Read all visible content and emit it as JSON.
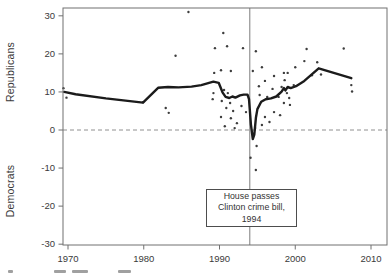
{
  "figure": {
    "background": "#ffffff",
    "ink": "#3a3a3a"
  },
  "chart_data": {
    "type": "scatter",
    "title": "",
    "xlabel": "",
    "ylabel_upper": "Republicans",
    "ylabel_lower": "Democrats",
    "grid": "off",
    "legend": "none",
    "x_axis": {
      "ticks": [
        1970,
        1980,
        1990,
        2000,
        2010
      ],
      "range": [
        1969.3,
        2012.1
      ]
    },
    "y_axis": {
      "ticks": [
        30,
        20,
        10,
        0,
        -10,
        -20,
        -30
      ],
      "range": [
        -32,
        32.1
      ]
    },
    "zero_line_y": 0,
    "event_line_x": 1994,
    "annotation": {
      "lines": [
        "House passes",
        "Clinton crime bill,",
        "1994"
      ]
    },
    "colors": {
      "trend": "#1b1b1b",
      "scatter": "#3d3d3d",
      "event_line": "#7d7d7d",
      "zero_line": "#909090",
      "frame": "#707070",
      "tick_text": "#3a3a3a"
    },
    "series": [
      {
        "name": "observations",
        "kind": "scatter",
        "points": [
          [
            1969.4,
            11.0
          ],
          [
            1969.8,
            8.5
          ],
          [
            1979.9,
            7.3
          ],
          [
            1982.9,
            5.8
          ],
          [
            1983.3,
            4.5
          ],
          [
            1984.2,
            19.5
          ],
          [
            1985.9,
            31.0
          ],
          [
            1989.1,
            8.1
          ],
          [
            1989.2,
            9.7
          ],
          [
            1989.3,
            15.0
          ],
          [
            1989.4,
            21.5
          ],
          [
            1990.2,
            15.7
          ],
          [
            1990.2,
            3.4
          ],
          [
            1990.3,
            7.6
          ],
          [
            1990.5,
            25.5
          ],
          [
            1990.6,
            10.5
          ],
          [
            1990.7,
            1.0
          ],
          [
            1990.9,
            5.8
          ],
          [
            1991.0,
            22.0
          ],
          [
            1991.1,
            9.7
          ],
          [
            1991.4,
            7.1
          ],
          [
            1991.5,
            15.5
          ],
          [
            1991.5,
            3.1
          ],
          [
            1991.8,
            5.0
          ],
          [
            1992.0,
            0.5
          ],
          [
            1992.3,
            1.8
          ],
          [
            1992.9,
            6.3
          ],
          [
            1993.1,
            21.5
          ],
          [
            1993.5,
            4.7
          ],
          [
            1994.1,
            -7.3
          ],
          [
            1994.4,
            15.5
          ],
          [
            1994.7,
            0.5
          ],
          [
            1994.8,
            20.7
          ],
          [
            1994.8,
            -10.5
          ],
          [
            1994.9,
            -4.2
          ],
          [
            1995.2,
            11.5
          ],
          [
            1995.3,
            9.2
          ],
          [
            1995.6,
            16.5
          ],
          [
            1995.6,
            1.3
          ],
          [
            1996.0,
            12.9
          ],
          [
            1996.0,
            3.4
          ],
          [
            1996.3,
            8.7
          ],
          [
            1996.6,
            2.1
          ],
          [
            1997.0,
            10.8
          ],
          [
            1997.2,
            14.2
          ],
          [
            1997.2,
            4.7
          ],
          [
            1997.8,
            8.7
          ],
          [
            1998.0,
            3.9
          ],
          [
            1998.2,
            11.3
          ],
          [
            1998.5,
            15.0
          ],
          [
            1998.5,
            7.1
          ],
          [
            1998.6,
            13.1
          ],
          [
            1998.9,
            9.7
          ],
          [
            1999.0,
            15.0
          ],
          [
            1999.2,
            8.4
          ],
          [
            1999.3,
            6.6
          ],
          [
            1999.8,
            11.8
          ],
          [
            2000.0,
            16.5
          ],
          [
            2001.2,
            18.1
          ],
          [
            2001.5,
            21.3
          ],
          [
            2002.2,
            14.4
          ],
          [
            2002.9,
            17.8
          ],
          [
            2003.4,
            14.6
          ],
          [
            2006.4,
            21.4
          ],
          [
            2007.4,
            11.8
          ],
          [
            2007.5,
            10.1
          ]
        ]
      },
      {
        "name": "smoothed-trend",
        "kind": "line",
        "points": [
          [
            1969.5,
            10.0
          ],
          [
            1971,
            9.4
          ],
          [
            1975,
            8.3
          ],
          [
            1979.9,
            7.2
          ],
          [
            1981.9,
            11.1
          ],
          [
            1983.2,
            11.3
          ],
          [
            1984.6,
            11.2
          ],
          [
            1986.3,
            11.4
          ],
          [
            1987.6,
            11.8
          ],
          [
            1989.2,
            12.7
          ],
          [
            1989.9,
            12.4
          ],
          [
            1990.4,
            9.9
          ],
          [
            1990.8,
            8.7
          ],
          [
            1991.3,
            8.4
          ],
          [
            1991.7,
            8.8
          ],
          [
            1992.1,
            8.5
          ],
          [
            1992.7,
            9.1
          ],
          [
            1993.2,
            9.3
          ],
          [
            1993.7,
            9.3
          ],
          [
            1993.9,
            8.1
          ],
          [
            1994.15,
            1.5
          ],
          [
            1994.4,
            -2.4
          ],
          [
            1994.6,
            -1.2
          ],
          [
            1994.8,
            3.2
          ],
          [
            1995.0,
            5.5
          ],
          [
            1995.5,
            7.4
          ],
          [
            1996.1,
            8.1
          ],
          [
            1996.8,
            8.3
          ],
          [
            1997.5,
            8.8
          ],
          [
            1998.2,
            10.1
          ],
          [
            1998.5,
            11.0
          ],
          [
            1998.7,
            10.4
          ],
          [
            1999.0,
            11.3
          ],
          [
            1999.4,
            11.0
          ],
          [
            2000.1,
            11.5
          ],
          [
            2001.2,
            12.9
          ],
          [
            2003.1,
            16.2
          ],
          [
            2007.4,
            13.6
          ]
        ]
      }
    ],
    "cropped_caption_marks": [
      {
        "x": 8,
        "w": 5
      },
      {
        "x": 54,
        "w": 12
      },
      {
        "x": 72,
        "w": 16
      },
      {
        "x": 118,
        "w": 13
      }
    ]
  }
}
